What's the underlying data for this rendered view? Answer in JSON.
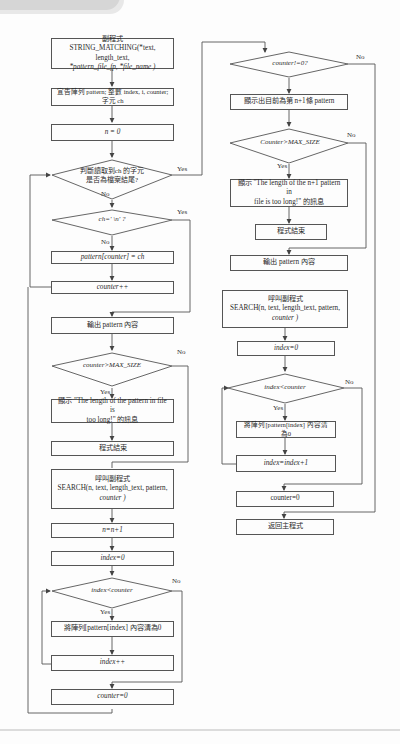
{
  "flowchart": {
    "left_column": {
      "subroutine_header": {
        "line1": "副程式",
        "line2": "STRING_MATCHING(*text, length_text,",
        "line3": "*pattern_file_fp, *file_name )"
      },
      "declare": {
        "line1": "宣告陣列 pattern; 整數 index, i, counter;",
        "line2": "字元 ch"
      },
      "init_n": "n = 0",
      "eof_check": {
        "line1": "判斷讀取到ch 的字元",
        "line2": "是否為檔案結尾?"
      },
      "newline_check": "ch=' \\n' ?",
      "assign_pattern": "pattern[counter] = ch",
      "counter_inc": "counter++",
      "output_pattern": "輸出 pattern 內容",
      "size_check": "counter>MAX_SIZE",
      "too_long_msg": {
        "line1": "顯示 \"The length of the pattern in file is",
        "line2": "too long!\" 的訊息"
      },
      "end_program": "程式結束",
      "call_search": {
        "line1": "呼叫副程式",
        "line2": "SEARCH(n, text, length_text, pattern,",
        "line3": "counter )"
      },
      "n_inc": "n=n+1",
      "index_init": "index=0",
      "index_check": "index<counter",
      "clear_pattern": "將陣列[pattern[index] 內容清為0",
      "index_inc": "index++",
      "counter_reset": "counter=0"
    },
    "right_column": {
      "counter_nonzero": "counter!=0?",
      "show_last": "顯示出目前為第 n+1條 pattern",
      "size_check": "Counter>MAX_SIZE",
      "too_long_msg": {
        "line1": "顯示 \"The length of the n+1 pattern in",
        "line2": "file is too long!\" 的訊息"
      },
      "end_program": "程式結束",
      "output_pattern": "輸出 pattern 內容",
      "call_search": {
        "line1": "呼叫副程式",
        "line2": "SEARCH(n, text, length_text, pattern,",
        "line3": "counter )"
      },
      "index_init": "index=0",
      "index_check": "index<counter",
      "clear_pattern": "將陣列[pattern[index] 內容清為0",
      "index_inc": "index=index+1",
      "counter_reset": "counter=0",
      "return_main": "返回主程式"
    },
    "labels": {
      "yes": "Yes",
      "no": "No"
    }
  }
}
